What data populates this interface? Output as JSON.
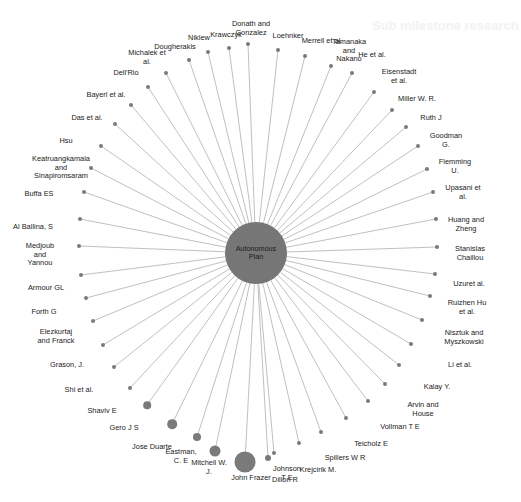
{
  "figure": {
    "type": "network-graph",
    "layout": "radial-hub-and-spoke",
    "background_color": "#ffffff",
    "node_color": "#7a7a7a",
    "edge_color": "#b0b0b0",
    "label_color": "#1a1a1a",
    "width": 521,
    "height": 502
  },
  "hub": {
    "label": "Autonomous\nPlan",
    "cx": 256,
    "cy": 253,
    "r": 31
  },
  "bleed_text": [
    {
      "text": "Sub milestone research",
      "x": 372,
      "y": 18
    }
  ],
  "chart_data": {
    "type": "network",
    "title": "Autonomous Plan",
    "center_node": "Autonomous Plan",
    "node_count": 49,
    "edge_count": 48,
    "nodes": [
      {
        "label": "Donath and\nGonzalez",
        "lx": 251,
        "ly": 29,
        "nx": 248,
        "ny": 44,
        "r": 2.0
      },
      {
        "label": "Krawczyk",
        "lx": 226,
        "ly": 35,
        "nx": 229,
        "ny": 48,
        "r": 2.0
      },
      {
        "label": "Loehnker",
        "lx": 288,
        "ly": 36,
        "nx": 278,
        "ny": 50,
        "r": 2.0
      },
      {
        "label": "Niklew",
        "lx": 199,
        "ly": 38,
        "nx": 208,
        "ny": 52,
        "r": 2.0
      },
      {
        "label": "Merrell et al.",
        "lx": 322,
        "ly": 41,
        "nx": 305,
        "ny": 56,
        "r": 2.0
      },
      {
        "label": "Dougherakis",
        "lx": 175,
        "ly": 47,
        "nx": 189,
        "ny": 60,
        "r": 2.0
      },
      {
        "label": "Tamanaka\nand\nNakano",
        "lx": 349,
        "ly": 51,
        "nx": 331,
        "ny": 66,
        "r": 2.0
      },
      {
        "label": "Michalek et\nal.",
        "lx": 147,
        "ly": 58,
        "nx": 166,
        "ny": 73,
        "r": 2.0
      },
      {
        "label": "He et al.",
        "lx": 372,
        "ly": 55,
        "nx": 352,
        "ny": 73,
        "r": 2.0
      },
      {
        "label": "Dell'Rio",
        "lx": 126,
        "ly": 73,
        "nx": 148,
        "ny": 87,
        "r": 2.0
      },
      {
        "label": "Eisenstadt\net al.",
        "lx": 399,
        "ly": 77,
        "nx": 374,
        "ny": 92,
        "r": 2.0
      },
      {
        "label": "Bayerl et al.",
        "lx": 106,
        "ly": 95,
        "nx": 131,
        "ny": 105,
        "r": 2.0
      },
      {
        "label": "Miller W. R.",
        "lx": 417,
        "ly": 99,
        "nx": 392,
        "ny": 110,
        "r": 2.0
      },
      {
        "label": "Das et al.",
        "lx": 87,
        "ly": 118,
        "nx": 115,
        "ny": 124,
        "r": 2.0
      },
      {
        "label": "Ruth J",
        "lx": 431,
        "ly": 118,
        "nx": 406,
        "ny": 127,
        "r": 2.0
      },
      {
        "label": "Hsu",
        "lx": 66,
        "ly": 141,
        "nx": 101,
        "ny": 146,
        "r": 2.0
      },
      {
        "label": "Goodman\nG.",
        "lx": 446,
        "ly": 141,
        "nx": 418,
        "ny": 146,
        "r": 2.0
      },
      {
        "label": "Keatruangkamala\nand\nSinapiromsaram",
        "lx": 61,
        "ly": 168,
        "nx": 91,
        "ny": 168,
        "r": 2.0
      },
      {
        "label": "Flemming\nU.",
        "lx": 455,
        "ly": 167,
        "nx": 427,
        "ny": 169,
        "r": 2.0
      },
      {
        "label": "Buffa ES",
        "lx": 39,
        "ly": 194,
        "nx": 84,
        "ny": 192,
        "r": 2.0
      },
      {
        "label": "Upasani et\nal.",
        "lx": 463,
        "ly": 193,
        "nx": 433,
        "ny": 192,
        "r": 2.0
      },
      {
        "label": "Al Ballina, S",
        "lx": 33,
        "ly": 227,
        "nx": 80,
        "ny": 219,
        "r": 2.0
      },
      {
        "label": "Huang and\nZheng",
        "lx": 466,
        "ly": 225,
        "nx": 436,
        "ny": 219,
        "r": 2.0
      },
      {
        "label": "Medjoub\nand\nYannou",
        "lx": 40,
        "ly": 255,
        "nx": 79,
        "ny": 246,
        "r": 2.0
      },
      {
        "label": "Stanislas\nChaillou",
        "lx": 470,
        "ly": 254,
        "nx": 437,
        "ny": 247,
        "r": 2.0
      },
      {
        "label": "Armour GL",
        "lx": 46,
        "ly": 288,
        "nx": 81,
        "ny": 275,
        "r": 2.0
      },
      {
        "label": "Uzuret al.",
        "lx": 469,
        "ly": 284,
        "nx": 435,
        "ny": 274,
        "r": 2.0
      },
      {
        "label": "Forth G",
        "lx": 44,
        "ly": 312,
        "nx": 86,
        "ny": 298,
        "r": 2.0
      },
      {
        "label": "Ruizhen Hu\net al.",
        "lx": 467,
        "ly": 308,
        "nx": 430,
        "ny": 296,
        "r": 2.0
      },
      {
        "label": "Elezkurtaj\nand Franck",
        "lx": 56,
        "ly": 337,
        "nx": 93,
        "ny": 321,
        "r": 2.0
      },
      {
        "label": "Nisztuk and\nMyszkowski",
        "lx": 464,
        "ly": 338,
        "nx": 422,
        "ny": 320,
        "r": 2.0
      },
      {
        "label": "Grason, J.",
        "lx": 67,
        "ly": 365,
        "nx": 103,
        "ny": 345,
        "r": 2.0
      },
      {
        "label": "Li et al.",
        "lx": 460,
        "ly": 365,
        "nx": 411,
        "ny": 344,
        "r": 2.0
      },
      {
        "label": "Shi et al.",
        "lx": 79,
        "ly": 390,
        "nx": 114,
        "ny": 367,
        "r": 2.0
      },
      {
        "label": "Kalay Y.",
        "lx": 437,
        "ly": 387,
        "nx": 399,
        "ny": 365,
        "r": 2.0
      },
      {
        "label": "Shaviv E",
        "lx": 102,
        "ly": 411,
        "nx": 130,
        "ny": 388,
        "r": 2.0
      },
      {
        "label": "Arvin and\nHouse",
        "lx": 423,
        "ly": 410,
        "nx": 385,
        "ny": 384,
        "r": 2.0
      },
      {
        "label": "Gero J S",
        "lx": 124,
        "ly": 428,
        "nx": 147,
        "ny": 405,
        "r": 3.8
      },
      {
        "label": "Vollman T E",
        "lx": 400,
        "ly": 427,
        "nx": 368,
        "ny": 401,
        "r": 2.0
      },
      {
        "label": "Jose Duarte",
        "lx": 152,
        "ly": 447,
        "nx": 172,
        "ny": 424,
        "r": 4.8
      },
      {
        "label": "Teicholz E",
        "lx": 371,
        "ly": 444,
        "nx": 346,
        "ny": 418,
        "r": 2.0
      },
      {
        "label": "Eastman,\nC. E",
        "lx": 181,
        "ly": 457,
        "nx": 197,
        "ny": 437,
        "r": 4.0
      },
      {
        "label": "Spillers W R",
        "lx": 345,
        "ly": 458,
        "nx": 321,
        "ny": 432,
        "r": 2.0
      },
      {
        "label": "Mitchell W.\nJ.",
        "lx": 209,
        "ly": 468,
        "nx": 215,
        "ny": 451,
        "r": 5.5
      },
      {
        "label": "Krejcirik M.",
        "lx": 318,
        "ly": 470,
        "nx": 299,
        "ny": 443,
        "r": 2.0
      },
      {
        "label": "John Frazer",
        "lx": 251,
        "ly": 478,
        "nx": 245,
        "ny": 462,
        "r": 10.5
      },
      {
        "label": "Johnson\nT E",
        "lx": 287,
        "ly": 474,
        "nx": 274,
        "ny": 453,
        "r": 2.0
      },
      {
        "label": "Dillon R",
        "lx": 285,
        "ly": 480,
        "nx": 268,
        "ny": 458,
        "r": 3.0
      }
    ]
  }
}
